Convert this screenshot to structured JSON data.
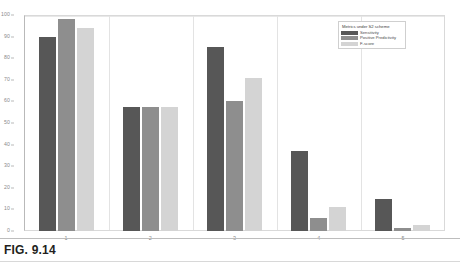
{
  "figure": {
    "caption": "FIG. 9.14"
  },
  "chart_data": {
    "type": "bar",
    "title": "",
    "xlabel": "",
    "ylabel": "",
    "categories": [
      "1",
      "2",
      "3",
      "4",
      "5"
    ],
    "series": [
      {
        "name": "Sensitivity",
        "color": "#575757",
        "values": [
          90,
          57.5,
          85,
          37,
          15
        ]
      },
      {
        "name": "Positive Predictivity",
        "color": "#8e8e8e",
        "values": [
          98,
          57.5,
          60,
          6,
          1.5
        ]
      },
      {
        "name": "F-score",
        "color": "#d4d4d4",
        "values": [
          94,
          57.5,
          71,
          11,
          3
        ]
      }
    ],
    "ylim": [
      0,
      100
    ],
    "yticks": [
      0,
      10,
      20,
      30,
      40,
      50,
      60,
      70,
      80,
      90,
      100
    ],
    "ytick_labels": [
      "0",
      "10",
      "20",
      "30",
      "40",
      "50",
      "60",
      "70",
      "80",
      "90",
      "100"
    ],
    "grid": "vertical-separators",
    "legend": {
      "title": "Metrics under S2 scheme",
      "position": "top-right",
      "entries": [
        "Sensitivity",
        "Positive Predictivity",
        "F-score"
      ]
    }
  }
}
